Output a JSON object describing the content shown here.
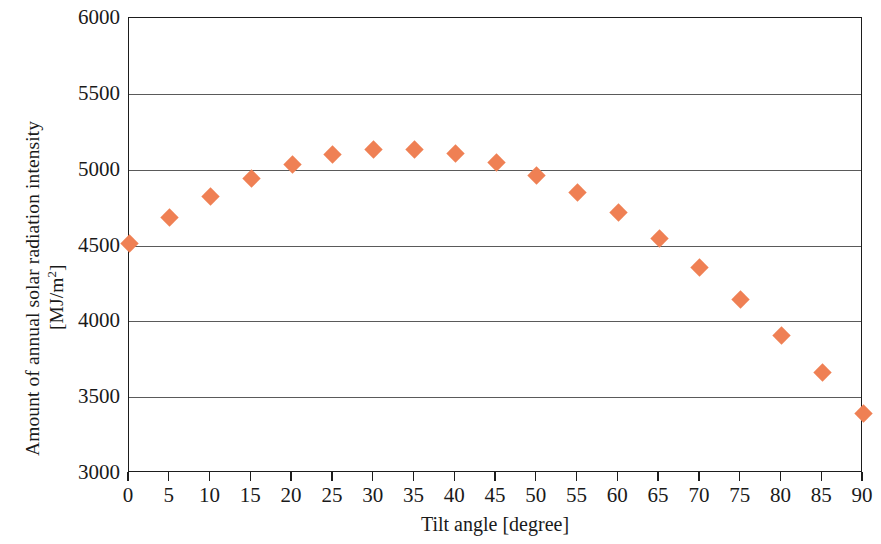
{
  "chart_data": {
    "type": "scatter",
    "title": "",
    "xlabel": "Tilt angle [degree]",
    "ylabel_line1": "Amount of annual solar radiation intensity",
    "ylabel_line2_prefix": "[MJ/m",
    "ylabel_line2_sup": "2",
    "ylabel_line2_suffix": "]",
    "x": [
      0,
      5,
      10,
      15,
      20,
      25,
      30,
      35,
      40,
      45,
      50,
      55,
      60,
      65,
      70,
      75,
      80,
      85,
      90
    ],
    "values": [
      4515,
      4685,
      4825,
      4945,
      5035,
      5100,
      5135,
      5135,
      5105,
      5050,
      4960,
      4850,
      4720,
      4545,
      4355,
      4145,
      3905,
      3660,
      3390
    ],
    "series": [
      {
        "name": "Annual solar radiation intensity",
        "marker": "diamond",
        "color": "#ef8054",
        "values": [
          4515,
          4685,
          4825,
          4945,
          5035,
          5100,
          5135,
          5135,
          5105,
          5050,
          4960,
          4850,
          4720,
          4545,
          4355,
          4145,
          3905,
          3660,
          3390
        ]
      }
    ],
    "xlim": [
      0,
      90
    ],
    "ylim": [
      3000,
      6000
    ],
    "xticks": [
      0,
      5,
      10,
      15,
      20,
      25,
      30,
      35,
      40,
      45,
      50,
      55,
      60,
      65,
      70,
      75,
      80,
      85,
      90
    ],
    "xtick_labels": [
      "0",
      "5",
      "10",
      "15",
      "20",
      "25",
      "30",
      "35",
      "40",
      "45",
      "50",
      "55",
      "60",
      "65",
      "70",
      "75",
      "80",
      "85",
      "90"
    ],
    "yticks": [
      3000,
      3500,
      4000,
      4500,
      5000,
      5500,
      6000
    ],
    "ytick_labels": [
      "3000",
      "3500",
      "4000",
      "4500",
      "5000",
      "5500",
      "6000"
    ],
    "grid": "horizontal",
    "legend": "none",
    "axis_color": "#1d1d1d",
    "gridline_color": "#5a5a5a",
    "background": "#ffffff"
  }
}
